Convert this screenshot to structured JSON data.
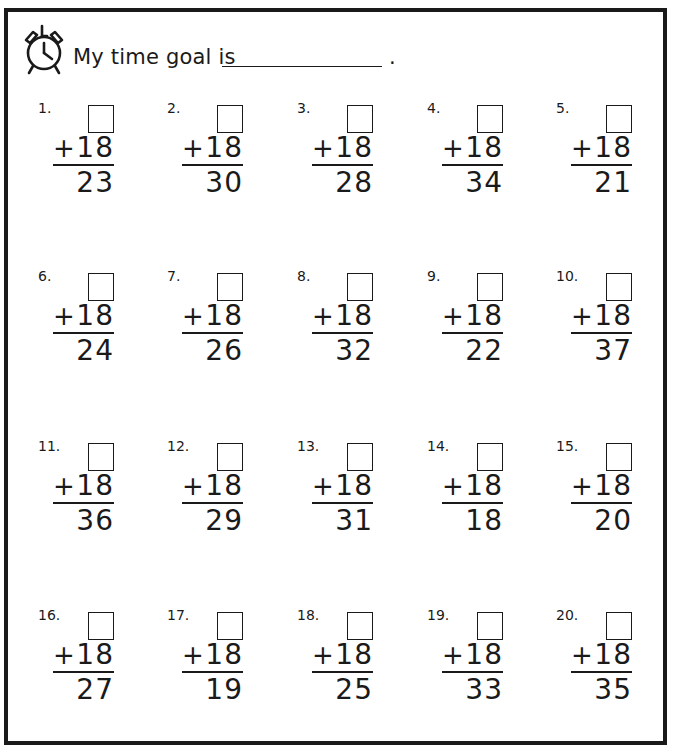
{
  "header": {
    "icon": "alarm-clock-icon",
    "goal_label": "My time goal is",
    "goal_value": "",
    "goal_period": "."
  },
  "problems": [
    {
      "label": "1.",
      "operator": "+",
      "addend": "18",
      "sum": "23"
    },
    {
      "label": "2.",
      "operator": "+",
      "addend": "18",
      "sum": "30"
    },
    {
      "label": "3.",
      "operator": "+",
      "addend": "18",
      "sum": "28"
    },
    {
      "label": "4.",
      "operator": "+",
      "addend": "18",
      "sum": "34"
    },
    {
      "label": "5.",
      "operator": "+",
      "addend": "18",
      "sum": "21"
    },
    {
      "label": "6.",
      "operator": "+",
      "addend": "18",
      "sum": "24"
    },
    {
      "label": "7.",
      "operator": "+",
      "addend": "18",
      "sum": "26"
    },
    {
      "label": "8.",
      "operator": "+",
      "addend": "18",
      "sum": "32"
    },
    {
      "label": "9.",
      "operator": "+",
      "addend": "18",
      "sum": "22"
    },
    {
      "label": "10.",
      "operator": "+",
      "addend": "18",
      "sum": "37"
    },
    {
      "label": "11.",
      "operator": "+",
      "addend": "18",
      "sum": "36"
    },
    {
      "label": "12.",
      "operator": "+",
      "addend": "18",
      "sum": "29"
    },
    {
      "label": "13.",
      "operator": "+",
      "addend": "18",
      "sum": "31"
    },
    {
      "label": "14.",
      "operator": "+",
      "addend": "18",
      "sum": "18"
    },
    {
      "label": "15.",
      "operator": "+",
      "addend": "18",
      "sum": "20"
    },
    {
      "label": "16.",
      "operator": "+",
      "addend": "18",
      "sum": "27"
    },
    {
      "label": "17.",
      "operator": "+",
      "addend": "18",
      "sum": "19"
    },
    {
      "label": "18.",
      "operator": "+",
      "addend": "18",
      "sum": "25"
    },
    {
      "label": "19.",
      "operator": "+",
      "addend": "18",
      "sum": "33"
    },
    {
      "label": "20.",
      "operator": "+",
      "addend": "18",
      "sum": "35"
    }
  ],
  "colors": {
    "ink": "#1a1a1a",
    "paper": "#ffffff"
  }
}
